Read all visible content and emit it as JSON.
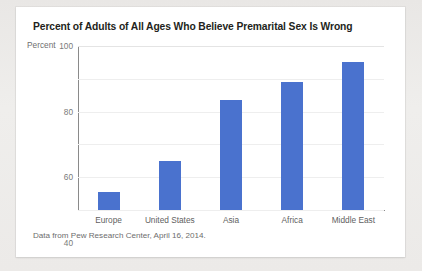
{
  "card": {
    "source_note": "Data from Pew Research Center, April 16, 2014.",
    "axis_unit_label": "Percent"
  },
  "chart_data": {
    "type": "bar",
    "title": "Percent of Adults of All Ages Who Believe Premarital Sex Is Wrong",
    "categories": [
      "Europe",
      "United States",
      "Asia",
      "Africa",
      "Middle East"
    ],
    "values": [
      11,
      30,
      67,
      78,
      90
    ],
    "xlabel": "",
    "ylabel": "Percent",
    "ylim": [
      0,
      100
    ],
    "yticks": [
      100,
      80,
      60,
      40,
      20,
      0
    ],
    "grid": true,
    "legend": false,
    "bar_color": "#4a72ce",
    "source": "Data from Pew Research Center, April 16, 2014."
  }
}
